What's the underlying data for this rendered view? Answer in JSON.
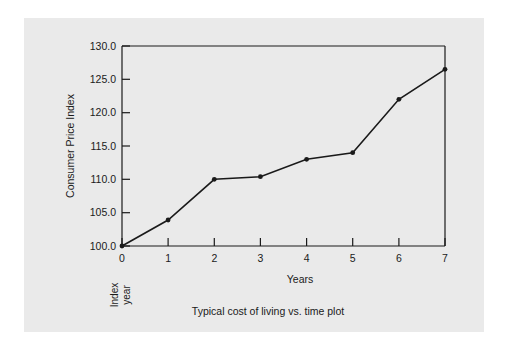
{
  "figure": {
    "background_color": "#eaeaea",
    "page_color": "#ffffff",
    "line_color": "#1a1a1a",
    "caption": "Typical cost of living vs. time plot",
    "index_year_note_line1": "Index",
    "index_year_note_line2": "year"
  },
  "chart_data": {
    "type": "line",
    "title": "",
    "caption": "Typical cost of living vs. time plot",
    "xlabel": "Years",
    "ylabel": "Consumer Price Index",
    "x": [
      0,
      1,
      2,
      3,
      4,
      5,
      6,
      7
    ],
    "values": [
      100.0,
      103.9,
      110.0,
      110.4,
      113.0,
      114.0,
      122.0,
      126.5
    ],
    "series": [
      {
        "name": "Consumer Price Index",
        "values": [
          100.0,
          103.9,
          110.0,
          110.4,
          113.0,
          114.0,
          122.0,
          126.5
        ]
      }
    ],
    "xlim": [
      0,
      7
    ],
    "ylim": [
      100.0,
      130.0
    ],
    "xticks": [
      "0",
      "1",
      "2",
      "3",
      "4",
      "5",
      "6",
      "7"
    ],
    "yticks": [
      "100.0",
      "105.0",
      "110.0",
      "115.0",
      "120.0",
      "125.0",
      "130.0"
    ],
    "ytick_values": [
      100.0,
      105.0,
      110.0,
      115.0,
      120.0,
      125.0,
      130.0
    ],
    "grid": false,
    "legend": "none",
    "marker": "filled-circle",
    "line_color": "#1a1a1a",
    "annotations": [
      "Index year"
    ]
  }
}
